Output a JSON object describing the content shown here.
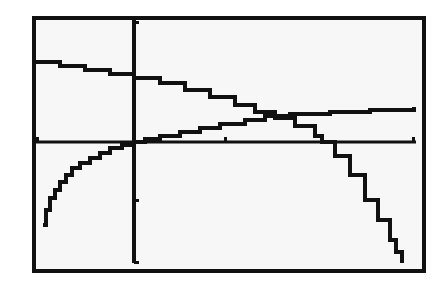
{
  "chart_data": {
    "type": "line",
    "title": "",
    "xlabel": "",
    "ylabel": "",
    "grid": false,
    "legend": null,
    "frame": {
      "x": 34,
      "y": 18,
      "width": 390,
      "height": 253,
      "stroke": 4
    },
    "axes": {
      "x_axis_y_px": 142,
      "y_axis_x_px": 134,
      "x_ticks_px": [
        38,
        226,
        414
      ],
      "y_ticks_px": [
        22,
        200,
        262
      ],
      "color": "#111111"
    },
    "series": [
      {
        "name": "decreasing curve",
        "points_px": [
          [
            36,
            62
          ],
          [
            60,
            66
          ],
          [
            85,
            70
          ],
          [
            110,
            74
          ],
          [
            134,
            78
          ],
          [
            160,
            83
          ],
          [
            185,
            90
          ],
          [
            210,
            97
          ],
          [
            235,
            105
          ],
          [
            255,
            112
          ],
          [
            275,
            118
          ],
          [
            295,
            126
          ],
          [
            315,
            136
          ],
          [
            322,
            142
          ],
          [
            335,
            156
          ],
          [
            350,
            175
          ],
          [
            365,
            200
          ],
          [
            378,
            220
          ],
          [
            390,
            240
          ],
          [
            396,
            252
          ],
          [
            402,
            263
          ]
        ]
      },
      {
        "name": "increasing curve",
        "points_px": [
          [
            43,
            225
          ],
          [
            46,
            210
          ],
          [
            50,
            198
          ],
          [
            55,
            190
          ],
          [
            60,
            182
          ],
          [
            66,
            175
          ],
          [
            72,
            168
          ],
          [
            80,
            163
          ],
          [
            90,
            158
          ],
          [
            100,
            153
          ],
          [
            110,
            148
          ],
          [
            122,
            145
          ],
          [
            134,
            142
          ],
          [
            145,
            139
          ],
          [
            160,
            136
          ],
          [
            180,
            132
          ],
          [
            200,
            128
          ],
          [
            220,
            124
          ],
          [
            245,
            120
          ],
          [
            265,
            116
          ],
          [
            290,
            114
          ],
          [
            330,
            112
          ],
          [
            370,
            110
          ],
          [
            414,
            107
          ]
        ]
      }
    ],
    "colors": {
      "background": "#f7f7f7",
      "ink": "#111111",
      "page": "#ffffff"
    }
  }
}
